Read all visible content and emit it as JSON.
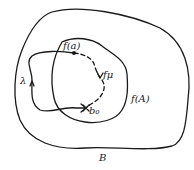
{
  "diagram": {
    "type": "set-mapping-sketch",
    "regions": [
      {
        "id": "B",
        "label": "B"
      },
      {
        "id": "fA",
        "label": "f(A)"
      }
    ],
    "points": [
      {
        "id": "fa",
        "label": "f(a)"
      },
      {
        "id": "b0",
        "label": "b₀",
        "marker": "x"
      }
    ],
    "paths": [
      {
        "id": "lambda",
        "label": "λ",
        "style": "solid",
        "from": "f(a)",
        "to": "b₀",
        "arrow": true
      },
      {
        "id": "fmu",
        "label": "fμ",
        "style": "dashed",
        "from": "f(a)",
        "to": "b₀",
        "arrow": true
      }
    ],
    "colors": {
      "ink": "#1a1a1a",
      "background": "#ffffff"
    }
  }
}
